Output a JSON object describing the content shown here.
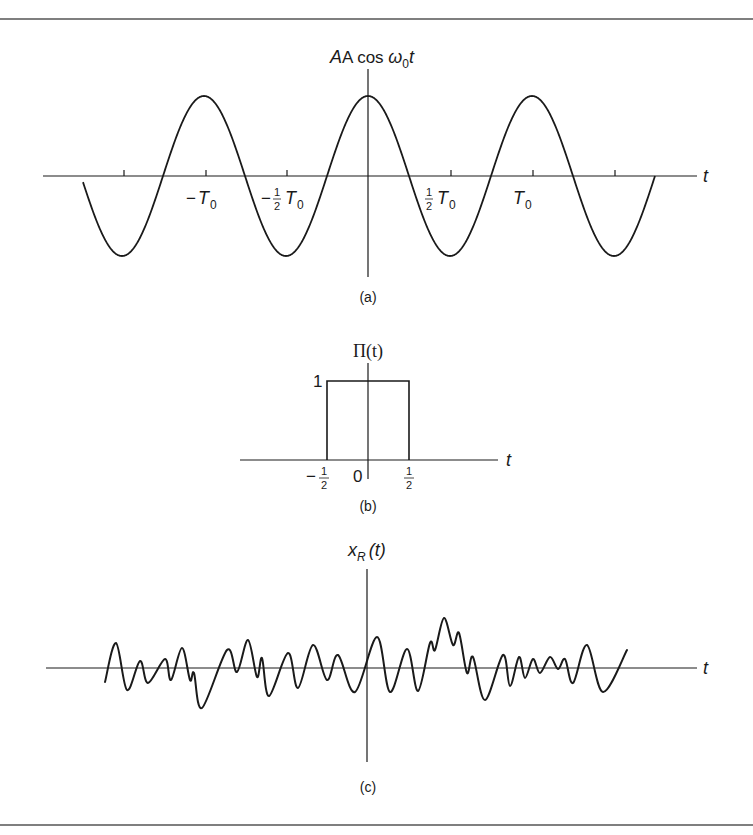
{
  "colors": {
    "ink": "#1a1a1a",
    "rule": "#555555",
    "background": "#ffffff"
  },
  "top_caption_clipped": "",
  "panels": {
    "a": {
      "caption": "(a)",
      "y_label": {
        "prefix": "A cos ",
        "omega": "ω",
        "sub": "0",
        "suffix": "t"
      },
      "x_label": "t",
      "ticks": [
        {
          "text": "−",
          "T": "T",
          "sub": "0",
          "frac": false,
          "x": 206
        },
        {
          "text": "−",
          "T": "T",
          "sub": "0",
          "frac": true,
          "x": 287
        },
        {
          "text": "",
          "T": "T",
          "sub": "0",
          "frac": true,
          "x": 451
        },
        {
          "text": "",
          "T": "T",
          "sub": "0",
          "frac": false,
          "x": 533
        }
      ],
      "tick_x": [
        124,
        206,
        287,
        451,
        533,
        615
      ],
      "geometry": {
        "axis_y": 176,
        "axis_x0": 43,
        "axis_x1": 697,
        "vaxis_x": 368,
        "vaxis_y0": 69,
        "vaxis_y1": 277,
        "amp": 80,
        "period_px": 164,
        "curve_x0": 83,
        "curve_x1": 655
      }
    },
    "b": {
      "caption": "(b)",
      "y_label": "Π(t)",
      "x_label": "t",
      "height_label": "1",
      "tick_labels": {
        "left": "−",
        "zero": "0",
        "num": "1",
        "den": "2"
      },
      "geometry": {
        "axis_y": 460,
        "axis_x0": 240,
        "axis_x1": 498,
        "vaxis_x": 368,
        "vaxis_y0": 363,
        "vaxis_y1": 479,
        "rect_x0": 327,
        "rect_x1": 409,
        "rect_top": 381
      }
    },
    "c": {
      "caption": "(c)",
      "y_label": {
        "x": "x",
        "sub": "R",
        "arg": "(t)"
      },
      "x_label": "t",
      "geometry": {
        "axis_y": 668,
        "axis_x0": 46,
        "axis_x1": 697,
        "vaxis_x": 367,
        "vaxis_y0": 569,
        "vaxis_y1": 762
      },
      "waveform_points": [
        [
          105,
          682
        ],
        [
          116,
          643
        ],
        [
          127,
          690
        ],
        [
          140,
          661
        ],
        [
          148,
          683
        ],
        [
          165,
          659
        ],
        [
          171,
          680
        ],
        [
          182,
          648
        ],
        [
          190,
          680
        ],
        [
          194,
          673
        ],
        [
          202,
          708
        ],
        [
          227,
          650
        ],
        [
          237,
          672
        ],
        [
          248,
          640
        ],
        [
          257,
          677
        ],
        [
          262,
          658
        ],
        [
          269,
          696
        ],
        [
          288,
          653
        ],
        [
          298,
          688
        ],
        [
          313,
          645
        ],
        [
          327,
          680
        ],
        [
          338,
          655
        ],
        [
          355,
          692
        ],
        [
          377,
          637
        ],
        [
          390,
          692
        ],
        [
          407,
          649
        ],
        [
          418,
          691
        ],
        [
          430,
          643
        ],
        [
          435,
          650
        ],
        [
          444,
          618
        ],
        [
          453,
          645
        ],
        [
          459,
          633
        ],
        [
          467,
          673
        ],
        [
          473,
          657
        ],
        [
          485,
          700
        ],
        [
          503,
          655
        ],
        [
          510,
          686
        ],
        [
          519,
          657
        ],
        [
          525,
          678
        ],
        [
          533,
          659
        ],
        [
          540,
          673
        ],
        [
          550,
          657
        ],
        [
          558,
          669
        ],
        [
          565,
          659
        ],
        [
          573,
          683
        ],
        [
          587,
          645
        ],
        [
          603,
          692
        ],
        [
          627,
          650
        ]
      ]
    }
  },
  "rules": {
    "top_y": 19,
    "bottom_y": 825
  }
}
